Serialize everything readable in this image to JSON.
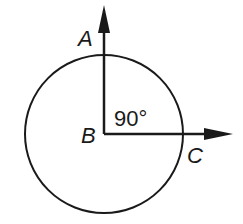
{
  "diagram": {
    "type": "geometry-angle-in-circle",
    "labels": {
      "point_a": "A",
      "point_b": "B",
      "point_c": "C",
      "angle": "90°"
    },
    "circle": {
      "cx": 104,
      "cy": 134,
      "r": 79
    },
    "vertex": {
      "x": 104,
      "y": 134
    },
    "ray_up_end": {
      "x": 104,
      "y": 6
    },
    "ray_right_end": {
      "x": 232,
      "y": 134
    },
    "colors": {
      "stroke": "#1a1a1a",
      "background": "#ffffff"
    }
  }
}
